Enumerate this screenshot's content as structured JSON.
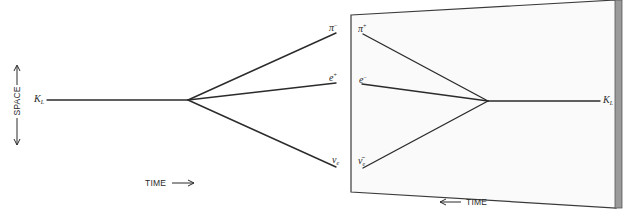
{
  "diagram": {
    "caption_fragment": "",
    "axes": {
      "space_label": "SPACE",
      "time_forward_label": "TIME",
      "time_reverse_label": "TIME"
    },
    "left_process": {
      "initial": {
        "symbol": "K",
        "subscript": "L"
      },
      "products": [
        {
          "symbol": "π",
          "superscript": "−"
        },
        {
          "symbol": "e",
          "superscript": "+"
        },
        {
          "symbol": "ν",
          "subscript": "e"
        }
      ]
    },
    "mirror_panel": {
      "products": [
        {
          "symbol": "π",
          "superscript": "+"
        },
        {
          "symbol": "e",
          "superscript": "−"
        },
        {
          "symbol": "ν̄",
          "subscript": "e"
        }
      ],
      "final": {
        "symbol": "K",
        "subscript": "L"
      }
    },
    "colors": {
      "line": "#2b2b2b",
      "panel_fill": "#fafafa",
      "panel_edge": "#9a9a9a"
    }
  }
}
